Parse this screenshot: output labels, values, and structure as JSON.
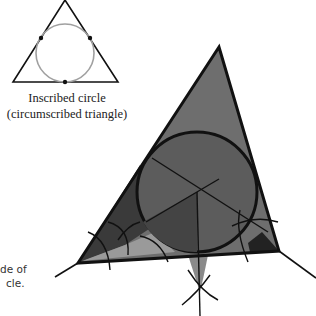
{
  "small_figure": {
    "caption_line1": "Inscribed circle",
    "caption_line2": "(circumscribed triangle)"
  },
  "side_note": {
    "line1": "de of",
    "line2": "cle."
  },
  "colors": {
    "stroke": "#111111",
    "small_circle": "#a0a0a0",
    "fill_light": "#9a9a9a",
    "fill_mid": "#6e6e6e",
    "fill_dark": "#4a4a4a",
    "fill_darkest": "#262626"
  }
}
